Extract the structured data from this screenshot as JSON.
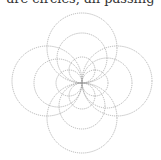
{
  "caption": "are circles, all passing",
  "figure": {
    "common_point": [
      82,
      83
    ],
    "stroke_color": "#9a9a9a",
    "circles": [
      {
        "cx": 82,
        "cy": 48,
        "r": 35
      },
      {
        "cx": 82,
        "cy": 118,
        "r": 35
      },
      {
        "cx": 47,
        "cy": 81,
        "r": 35
      },
      {
        "cx": 117,
        "cy": 81,
        "r": 35
      },
      {
        "cx": 82,
        "cy": 58,
        "r": 25
      },
      {
        "cx": 82,
        "cy": 106,
        "r": 23
      },
      {
        "cx": 58,
        "cy": 83,
        "r": 24
      },
      {
        "cx": 107,
        "cy": 83,
        "r": 25
      },
      {
        "cx": 82,
        "cy": 70,
        "r": 13
      },
      {
        "cx": 82,
        "cy": 96,
        "r": 13
      },
      {
        "cx": 69,
        "cy": 83,
        "r": 13
      },
      {
        "cx": 95,
        "cy": 83,
        "r": 13
      }
    ]
  }
}
